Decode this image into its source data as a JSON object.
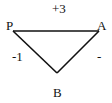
{
  "diagram": {
    "type": "signed-triangle-graph",
    "nodes": [
      {
        "id": "P",
        "label": "P",
        "x": 13,
        "y": 31
      },
      {
        "id": "A",
        "label": "A",
        "x": 99,
        "y": 31
      },
      {
        "id": "B",
        "label": "B",
        "x": 57,
        "y": 73
      }
    ],
    "edges": [
      {
        "from": "P",
        "to": "A",
        "label": "+3"
      },
      {
        "from": "P",
        "to": "B",
        "label": "-1"
      },
      {
        "from": "A",
        "to": "B",
        "label": "-"
      }
    ],
    "colors": {
      "line": "#111111",
      "background": "#ffffff"
    }
  }
}
